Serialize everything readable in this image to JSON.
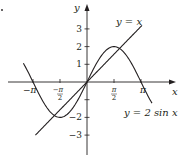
{
  "chart_data": {
    "type": "line",
    "title": "",
    "xlabel": "x",
    "ylabel": "y",
    "xlim": [
      -3.7,
      3.8
    ],
    "ylim": [
      -3.9,
      4.1
    ],
    "grid": false,
    "x_ticks": [
      {
        "value": -3.14159,
        "label": "−π",
        "num": "",
        "den": ""
      },
      {
        "value": -1.5708,
        "label": "",
        "num": "−π",
        "den": "2"
      },
      {
        "value": 1.5708,
        "label": "",
        "num": "π",
        "den": "2"
      },
      {
        "value": 3.14159,
        "label": "π",
        "num": "",
        "den": ""
      }
    ],
    "y_ticks": [
      {
        "value": 3,
        "label": "3"
      },
      {
        "value": 2,
        "label": "2"
      },
      {
        "value": 1,
        "label": "1"
      },
      {
        "value": -1,
        "label": ""
      },
      {
        "value": -2,
        "label": "−2"
      },
      {
        "value": -3,
        "label": "−3"
      }
    ],
    "series": [
      {
        "name": "y = x",
        "function": "x",
        "x_range": [
          -3.0,
          3.2
        ],
        "color": "#231f20"
      },
      {
        "name": "y = 2 sin x",
        "function": "2*sin(x)",
        "x_range": [
          -3.7,
          3.78
        ],
        "color": "#231f20"
      }
    ],
    "annotations": [
      {
        "text": "y = x",
        "near": "top-right of line y = x"
      },
      {
        "text": "y = 2 sin x",
        "near": "bottom-right, below sine curve end"
      }
    ]
  }
}
